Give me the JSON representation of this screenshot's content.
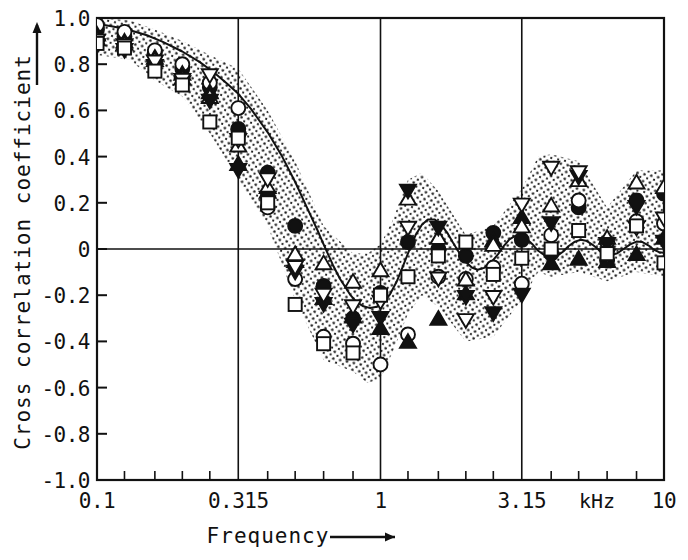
{
  "figure": {
    "background_color": "#ffffff",
    "ink_color": "#111111",
    "frame": {
      "left": 97,
      "top": 18,
      "right": 664,
      "bottom": 480
    }
  },
  "axes": {
    "y": {
      "title": "Cross correlation coefficient",
      "arrow": "up-arrow-icon",
      "min": -1.0,
      "max": 1.0,
      "tick_labels": [
        "1.0",
        "0.8",
        "0.6",
        "0.4",
        "0.2",
        "0",
        "-0.2",
        "-0.4",
        "-0.6",
        "-0.8",
        "-1.0"
      ],
      "tick_values": [
        1.0,
        0.8,
        0.6,
        0.4,
        0.2,
        0,
        -0.2,
        -0.4,
        -0.6,
        -0.8,
        -1.0
      ]
    },
    "x": {
      "title": "Frequency",
      "arrow": "right-arrow-icon",
      "unit": "kHz",
      "scale": "log",
      "min": 0.1,
      "max": 10,
      "tick_labels": [
        "0.1",
        "0.315",
        "1",
        "3.15",
        "10"
      ],
      "tick_values": [
        0.1,
        0.315,
        1,
        3.15,
        10
      ],
      "minor_tick_values": [
        0.125,
        0.16,
        0.2,
        0.25,
        0.4,
        0.5,
        0.63,
        0.8,
        1.25,
        1.6,
        2.0,
        2.5,
        4.0,
        5.0,
        6.3,
        8.0
      ]
    }
  },
  "chart_data": {
    "type": "scatter",
    "title": "",
    "xlabel": "Frequency",
    "ylabel": "Cross correlation coefficient",
    "xunit": "kHz",
    "xscale": "log",
    "xlim": [
      0.1,
      10
    ],
    "ylim": [
      -1.0,
      1.0
    ],
    "grid": true,
    "gridlines_x": [
      0.315,
      1,
      3.15
    ],
    "gridlines_y": [
      0
    ],
    "legend": "none",
    "x": [
      0.1,
      0.125,
      0.16,
      0.2,
      0.25,
      0.315,
      0.4,
      0.5,
      0.63,
      0.8,
      1.0,
      1.25,
      1.6,
      2.0,
      2.5,
      3.15,
      4.0,
      5.0,
      6.3,
      8.0,
      10.0
    ],
    "series": [
      {
        "name": "subject-1",
        "marker": "filled-circle",
        "values": [
          0.95,
          0.92,
          0.85,
          0.78,
          0.7,
          0.52,
          0.33,
          0.1,
          -0.16,
          -0.3,
          -0.19,
          0.03,
          0.0,
          -0.03,
          0.07,
          0.04,
          -0.02,
          0.18,
          -0.05,
          0.21,
          0.24
        ]
      },
      {
        "name": "subject-2",
        "marker": "open-circle",
        "values": [
          0.97,
          0.94,
          0.86,
          0.8,
          0.72,
          0.61,
          0.18,
          -0.13,
          -0.38,
          -0.41,
          -0.5,
          -0.37,
          -0.12,
          -0.13,
          -0.08,
          -0.15,
          0.06,
          0.21,
          0.03,
          0.12,
          0.11
        ]
      },
      {
        "name": "subject-3",
        "marker": "filled-triangle-up",
        "values": [
          0.93,
          0.9,
          0.83,
          0.76,
          0.68,
          0.37,
          0.25,
          -0.05,
          -0.21,
          -0.29,
          -0.34,
          -0.4,
          -0.3,
          -0.19,
          0.04,
          0.14,
          -0.06,
          -0.04,
          -0.05,
          -0.02,
          0.05
        ]
      },
      {
        "name": "subject-4",
        "marker": "open-triangle-up",
        "values": [
          0.91,
          0.89,
          0.82,
          0.74,
          0.66,
          0.45,
          0.27,
          -0.02,
          -0.06,
          -0.14,
          -0.09,
          0.22,
          0.05,
          -0.13,
          0.02,
          0.1,
          0.19,
          0.3,
          0.05,
          0.29,
          0.27
        ]
      },
      {
        "name": "subject-5",
        "marker": "filled-triangle-down",
        "values": [
          0.88,
          0.86,
          0.79,
          0.72,
          0.64,
          0.34,
          0.22,
          -0.1,
          -0.24,
          -0.33,
          -0.3,
          0.25,
          0.09,
          -0.21,
          -0.28,
          -0.2,
          0.11,
          0.31,
          0.02,
          0.18,
          0.03
        ]
      },
      {
        "name": "subject-6",
        "marker": "open-triangle-down",
        "values": [
          0.9,
          0.88,
          0.81,
          0.73,
          0.75,
          0.47,
          0.3,
          -0.08,
          -0.2,
          -0.25,
          -0.23,
          0.09,
          -0.13,
          -0.31,
          -0.21,
          0.19,
          0.35,
          0.33,
          -0.03,
          0.09,
          0.13
        ]
      },
      {
        "name": "subject-7",
        "marker": "open-square",
        "values": [
          0.89,
          0.87,
          0.77,
          0.71,
          0.55,
          0.48,
          0.2,
          -0.24,
          -0.41,
          -0.45,
          -0.2,
          -0.12,
          -0.03,
          0.03,
          -0.11,
          -0.04,
          0.0,
          0.08,
          -0.02,
          0.1,
          -0.06
        ]
      }
    ],
    "fit_curve": {
      "name": "model-curve",
      "style": "solid",
      "points": [
        [
          0.1,
          0.975
        ],
        [
          0.115,
          0.962
        ],
        [
          0.13,
          0.948
        ],
        [
          0.15,
          0.925
        ],
        [
          0.17,
          0.898
        ],
        [
          0.2,
          0.855
        ],
        [
          0.23,
          0.81
        ],
        [
          0.26,
          0.762
        ],
        [
          0.29,
          0.712
        ],
        [
          0.315,
          0.672
        ],
        [
          0.35,
          0.605
        ],
        [
          0.4,
          0.505
        ],
        [
          0.45,
          0.4
        ],
        [
          0.5,
          0.29
        ],
        [
          0.55,
          0.18
        ],
        [
          0.6,
          0.08
        ],
        [
          0.63,
          0.02
        ],
        [
          0.68,
          -0.07
        ],
        [
          0.72,
          -0.13
        ],
        [
          0.78,
          -0.196
        ],
        [
          0.82,
          -0.228
        ],
        [
          0.87,
          -0.248
        ],
        [
          0.92,
          -0.256
        ],
        [
          0.97,
          -0.25
        ],
        [
          1.02,
          -0.232
        ],
        [
          1.08,
          -0.196
        ],
        [
          1.14,
          -0.142
        ],
        [
          1.2,
          -0.075
        ],
        [
          1.26,
          -0.008
        ],
        [
          1.33,
          0.06
        ],
        [
          1.4,
          0.105
        ],
        [
          1.47,
          0.128
        ],
        [
          1.55,
          0.128
        ],
        [
          1.63,
          0.108
        ],
        [
          1.72,
          0.07
        ],
        [
          1.8,
          0.028
        ],
        [
          1.9,
          -0.018
        ],
        [
          2.0,
          -0.055
        ],
        [
          2.1,
          -0.08
        ],
        [
          2.2,
          -0.09
        ],
        [
          2.32,
          -0.082
        ],
        [
          2.45,
          -0.06
        ],
        [
          2.6,
          -0.022
        ],
        [
          2.72,
          0.012
        ],
        [
          2.85,
          0.042
        ],
        [
          3.0,
          0.058
        ],
        [
          3.15,
          0.056
        ],
        [
          3.3,
          0.04
        ],
        [
          3.45,
          0.018
        ],
        [
          3.6,
          -0.008
        ],
        [
          3.8,
          -0.028
        ],
        [
          4.0,
          -0.036
        ],
        [
          4.2,
          -0.03
        ],
        [
          4.4,
          -0.012
        ],
        [
          4.6,
          0.012
        ],
        [
          4.85,
          0.032
        ],
        [
          5.1,
          0.04
        ],
        [
          5.35,
          0.034
        ],
        [
          5.6,
          0.018
        ],
        [
          5.9,
          -0.004
        ],
        [
          6.2,
          -0.02
        ],
        [
          6.5,
          -0.026
        ],
        [
          6.85,
          -0.018
        ],
        [
          7.2,
          0.0
        ],
        [
          7.6,
          0.02
        ],
        [
          8.0,
          0.032
        ],
        [
          8.4,
          0.03
        ],
        [
          8.8,
          0.016
        ],
        [
          9.2,
          -0.002
        ],
        [
          9.6,
          -0.014
        ],
        [
          10.0,
          -0.016
        ]
      ]
    },
    "shaded_band": {
      "name": "scatter-envelope",
      "style": "stippled",
      "upper": [
        [
          0.1,
          1.0
        ],
        [
          0.13,
          0.99
        ],
        [
          0.16,
          0.95
        ],
        [
          0.2,
          0.9
        ],
        [
          0.25,
          0.84
        ],
        [
          0.315,
          0.78
        ],
        [
          0.4,
          0.6
        ],
        [
          0.5,
          0.38
        ],
        [
          0.63,
          0.1
        ],
        [
          0.8,
          -0.02
        ],
        [
          0.9,
          -0.02
        ],
        [
          1.0,
          0.02
        ],
        [
          1.1,
          0.12
        ],
        [
          1.25,
          0.3
        ],
        [
          1.4,
          0.33
        ],
        [
          1.6,
          0.25
        ],
        [
          2.0,
          0.06
        ],
        [
          2.5,
          0.1
        ],
        [
          3.15,
          0.26
        ],
        [
          3.6,
          0.4
        ],
        [
          4.0,
          0.41
        ],
        [
          5.0,
          0.38
        ],
        [
          6.3,
          0.18
        ],
        [
          8.0,
          0.34
        ],
        [
          10.0,
          0.34
        ]
      ],
      "lower": [
        [
          0.1,
          0.84
        ],
        [
          0.13,
          0.82
        ],
        [
          0.16,
          0.73
        ],
        [
          0.2,
          0.66
        ],
        [
          0.25,
          0.5
        ],
        [
          0.315,
          0.3
        ],
        [
          0.4,
          0.1
        ],
        [
          0.5,
          -0.22
        ],
        [
          0.63,
          -0.48
        ],
        [
          0.8,
          -0.53
        ],
        [
          0.9,
          -0.58
        ],
        [
          1.0,
          -0.56
        ],
        [
          1.1,
          -0.45
        ],
        [
          1.25,
          -0.28
        ],
        [
          1.4,
          -0.2
        ],
        [
          1.6,
          -0.25
        ],
        [
          2.0,
          -0.4
        ],
        [
          2.5,
          -0.38
        ],
        [
          3.15,
          -0.22
        ],
        [
          3.6,
          -0.1
        ],
        [
          4.0,
          -0.12
        ],
        [
          5.0,
          -0.1
        ],
        [
          6.3,
          -0.14
        ],
        [
          8.0,
          -0.1
        ],
        [
          10.0,
          -0.12
        ]
      ]
    }
  }
}
